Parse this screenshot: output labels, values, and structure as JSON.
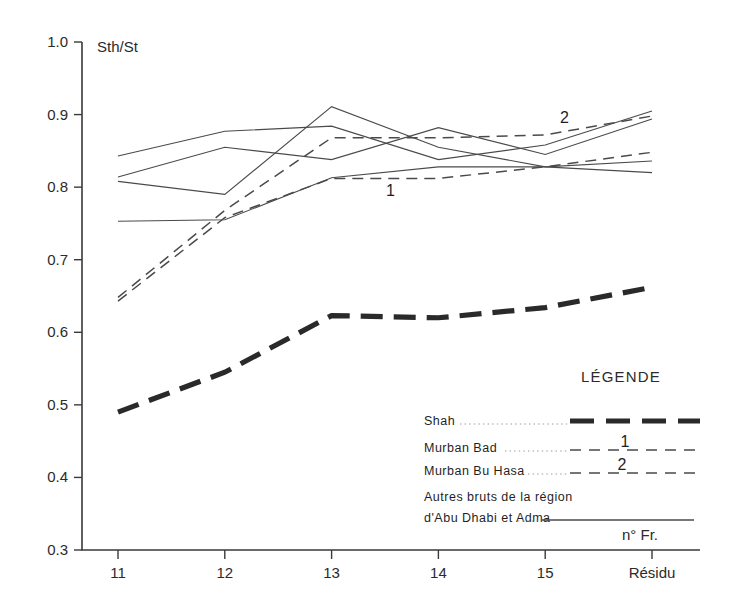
{
  "chart_data": {
    "type": "line",
    "title": "",
    "xlabel": "n° Fr.",
    "ylabel": "Sth/St",
    "x": [
      "11",
      "12",
      "13",
      "14",
      "15",
      "Résidu"
    ],
    "categories": [
      "11",
      "12",
      "13",
      "14",
      "15",
      "Résidu"
    ],
    "ylim": [
      0.3,
      1.0
    ],
    "yticks": [
      "0.3",
      "0.4",
      "0.5",
      "0.6",
      "0.7",
      "0.8",
      "0.9",
      "1.0"
    ],
    "ytick_values": [
      0.3,
      0.4,
      0.5,
      0.6,
      0.7,
      0.8,
      0.9,
      1.0
    ],
    "grid": false,
    "legend_position": "inside-bottom-right",
    "series": [
      {
        "name": "Shah",
        "style": "thick-dashed",
        "values": [
          0.49,
          0.545,
          0.623,
          0.62,
          0.634,
          0.662
        ]
      },
      {
        "name": "Murban Bad",
        "style": "dashed",
        "marker_label": "1",
        "values": [
          0.643,
          0.758,
          0.812,
          0.812,
          0.828,
          0.848
        ]
      },
      {
        "name": "Murban Bu Hasa",
        "style": "dashed",
        "marker_label": "2",
        "values": [
          0.648,
          0.768,
          0.868,
          0.868,
          0.872,
          0.898
        ]
      },
      {
        "name": "Autres bruts de la région d'Abu Dhabi et Adma — A",
        "style": "solid",
        "values": [
          0.843,
          0.877,
          0.884,
          0.838,
          0.858,
          0.905
        ]
      },
      {
        "name": "Autres bruts de la région d'Abu Dhabi et Adma — B",
        "style": "solid",
        "values": [
          0.814,
          0.855,
          0.838,
          0.882,
          0.845,
          0.894
        ]
      },
      {
        "name": "Autres bruts de la région d'Abu Dhabi et Adma — C",
        "style": "solid",
        "values": [
          0.808,
          0.79,
          0.911,
          0.855,
          0.828,
          0.836
        ]
      },
      {
        "name": "Autres bruts de la région d'Abu Dhabi et Adma — D",
        "style": "solid",
        "values": [
          0.753,
          0.755,
          0.813,
          0.828,
          0.828,
          0.82
        ]
      }
    ],
    "annotations": [
      {
        "text": "1",
        "x": 13.55,
        "y": 0.788
      },
      {
        "text": "2",
        "x": 15.18,
        "y": 0.888
      }
    ]
  },
  "legend": {
    "title": "LÉGENDE",
    "entries": [
      {
        "label": "Shah",
        "style": "thick-dashed",
        "number": ""
      },
      {
        "label": "Murban Bad",
        "style": "dashed",
        "number": "1"
      },
      {
        "label": "Murban Bu Hasa",
        "style": "dashed",
        "number": "2"
      },
      {
        "label": "Autres bruts de la région",
        "label2": "d'Abu Dhabi et Adma",
        "style": "solid",
        "number": ""
      }
    ]
  },
  "colors": {
    "axis": "#3a3a3a",
    "line": "#4a4a4a",
    "thick_line": "#2a2a2a",
    "background": "#ffffff"
  }
}
